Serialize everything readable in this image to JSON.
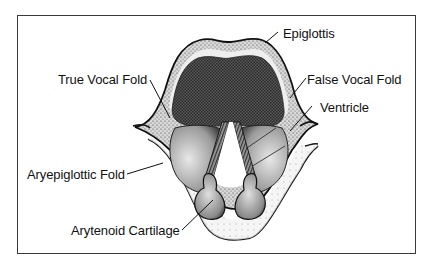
{
  "diagram": {
    "labels": {
      "epiglottis": "Epiglottis",
      "true_vocal_fold": "True Vocal Fold",
      "false_vocal_fold": "False Vocal Fold",
      "ventricle": "Ventricle",
      "aryepiglottic_fold": "Aryepiglottic Fold",
      "arytenoid_cartilage": "Arytenoid Cartilage"
    },
    "colors": {
      "line": "#111111",
      "frame": "#3a3a3a",
      "dark_fill": "#4a4a4a",
      "stipple_fill": "#bdbdbd",
      "light_fill": "#e6e6e6",
      "background": "#ffffff"
    }
  }
}
